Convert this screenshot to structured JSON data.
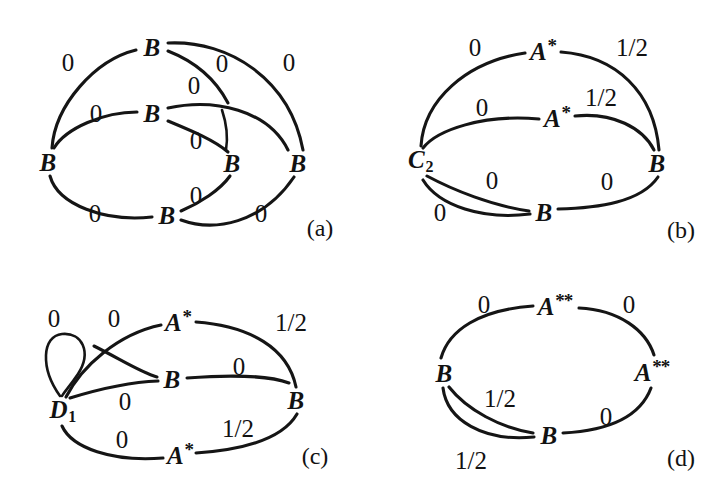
{
  "figure": {
    "type": "graph-diagram-grid",
    "panel_count": 4,
    "ink_color": "#151515",
    "background": "#ffffff"
  },
  "panels": [
    {
      "id": "a",
      "caption": "(a)",
      "nodes": [
        {
          "id": "a-n-top",
          "label": "B",
          "x": 152,
          "y": 47
        },
        {
          "id": "a-n-mid",
          "label": "B",
          "x": 152,
          "y": 113
        },
        {
          "id": "a-n-left",
          "label": "B",
          "x": 48,
          "y": 162
        },
        {
          "id": "a-n-inner",
          "label": "B",
          "x": 232,
          "y": 163
        },
        {
          "id": "a-n-right",
          "label": "B",
          "x": 298,
          "y": 163
        },
        {
          "id": "a-n-bottom",
          "label": "B",
          "x": 167,
          "y": 215
        }
      ],
      "edges": [
        {
          "from": "a-n-left",
          "to": "a-n-top",
          "weight": "0",
          "wx": 68,
          "wy": 62
        },
        {
          "from": "a-n-top",
          "to": "a-n-inner",
          "weight": "0",
          "wx": 222,
          "wy": 63
        },
        {
          "from": "a-n-top",
          "to": "a-n-right",
          "weight": "0",
          "wx": 289,
          "wy": 62
        },
        {
          "from": "a-n-mid",
          "to": "a-n-right",
          "weight": "0",
          "wx": 194,
          "wy": 85
        },
        {
          "from": "a-n-left",
          "to": "a-n-mid",
          "weight": "0",
          "wx": 96,
          "wy": 113
        },
        {
          "from": "a-n-mid",
          "to": "a-n-inner",
          "weight": "0",
          "wx": 196,
          "wy": 140
        },
        {
          "from": "a-n-left",
          "to": "a-n-bottom",
          "weight": "0",
          "wx": 95,
          "wy": 213
        },
        {
          "from": "a-n-bottom",
          "to": "a-n-inner",
          "weight": "0",
          "wx": 196,
          "wy": 195
        },
        {
          "from": "a-n-bottom",
          "to": "a-n-right",
          "weight": "0",
          "wx": 261,
          "wy": 213
        }
      ]
    },
    {
      "id": "b",
      "caption": "(b)",
      "nodes": [
        {
          "id": "b-n-a1",
          "label": "A",
          "sup": "*",
          "x": 182,
          "y": 50
        },
        {
          "id": "b-n-a2",
          "label": "A",
          "sup": "*",
          "x": 196,
          "y": 117
        },
        {
          "id": "b-n-c2",
          "label": "C",
          "sub": "2",
          "x": 60,
          "y": 161
        },
        {
          "id": "b-n-bright",
          "label": "B",
          "x": 296,
          "y": 163
        },
        {
          "id": "b-n-bbot",
          "label": "B",
          "x": 183,
          "y": 212
        }
      ],
      "edges": [
        {
          "from": "b-n-c2",
          "to": "b-n-a1",
          "weight": "0",
          "wx": 114,
          "wy": 47
        },
        {
          "from": "b-n-a1",
          "to": "b-n-bright",
          "weight": "1/2",
          "wx": 271,
          "wy": 47
        },
        {
          "from": "b-n-c2",
          "to": "b-n-a2",
          "weight": "0",
          "wx": 121,
          "wy": 107
        },
        {
          "from": "b-n-a2",
          "to": "b-n-bright",
          "weight": "1/2",
          "wx": 240,
          "wy": 97
        },
        {
          "from": "b-n-c2",
          "to": "b-n-bbot",
          "weight": "0",
          "wx": 131,
          "wy": 180
        },
        {
          "from": "b-n-c2",
          "to": "b-n-bbot",
          "weight": "0",
          "wx": 79,
          "wy": 212
        },
        {
          "from": "b-n-bbot",
          "to": "b-n-bright",
          "weight": "0",
          "wx": 246,
          "wy": 181
        }
      ]
    },
    {
      "id": "c",
      "caption": "(c)",
      "nodes": [
        {
          "id": "c-n-a1",
          "label": "A",
          "sup": "*",
          "x": 178,
          "y": 73
        },
        {
          "id": "c-n-bmid",
          "label": "B",
          "x": 172,
          "y": 131
        },
        {
          "id": "c-n-d1",
          "label": "D",
          "sub": "1",
          "x": 63,
          "y": 163
        },
        {
          "id": "c-n-brgt",
          "label": "B",
          "x": 296,
          "y": 152
        },
        {
          "id": "c-n-a2",
          "label": "A",
          "sup": "*",
          "x": 180,
          "y": 206
        }
      ],
      "edges": [
        {
          "from": "c-n-d1",
          "to": "c-n-d1",
          "weight": "0",
          "wx": 54,
          "wy": 70,
          "selfloop": true
        },
        {
          "from": "c-n-d1",
          "to": "c-n-a1",
          "weight": "0",
          "wx": 114,
          "wy": 70
        },
        {
          "from": "c-n-a1",
          "to": "c-n-brgt",
          "weight": "1/2",
          "wx": 291,
          "wy": 74
        },
        {
          "from": "c-n-d1",
          "to": "c-n-bmid",
          "weight": "0",
          "wx": 125,
          "wy": 153
        },
        {
          "from": "c-n-bmid",
          "to": "c-n-brgt",
          "weight": "0",
          "wx": 239,
          "wy": 118
        },
        {
          "from": "c-n-d1",
          "to": "c-n-a2",
          "weight": "0",
          "wx": 122,
          "wy": 191
        },
        {
          "from": "c-n-a2",
          "to": "c-n-brgt",
          "weight": "1/2",
          "wx": 238,
          "wy": 180
        }
      ]
    },
    {
      "id": "d",
      "caption": "(d)",
      "nodes": [
        {
          "id": "d-n-atop",
          "label": "A",
          "sup": "**",
          "x": 194,
          "y": 57
        },
        {
          "id": "d-n-bleft",
          "label": "B",
          "x": 83,
          "y": 125
        },
        {
          "id": "d-n-argt",
          "label": "A",
          "sup": "**",
          "x": 291,
          "y": 123
        },
        {
          "id": "d-n-bbot",
          "label": "B",
          "x": 188,
          "y": 187
        }
      ],
      "edges": [
        {
          "from": "d-n-bleft",
          "to": "d-n-atop",
          "weight": "0",
          "wx": 123,
          "wy": 56
        },
        {
          "from": "d-n-atop",
          "to": "d-n-argt",
          "weight": "0",
          "wx": 268,
          "wy": 56
        },
        {
          "from": "d-n-bleft",
          "to": "d-n-bbot",
          "weight": "1/2",
          "wx": 139,
          "wy": 150
        },
        {
          "from": "d-n-bleft",
          "to": "d-n-bbot",
          "weight": "1/2",
          "wx": 110,
          "wy": 212
        },
        {
          "from": "d-n-bbot",
          "to": "d-n-argt",
          "weight": "0",
          "wx": 245,
          "wy": 168
        }
      ]
    }
  ]
}
